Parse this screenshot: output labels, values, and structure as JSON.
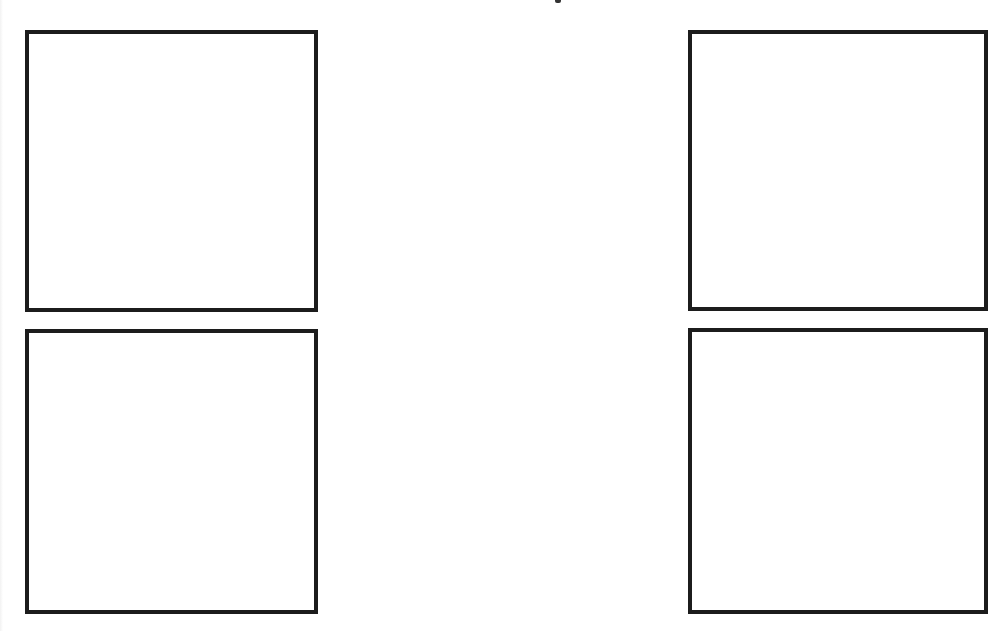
{
  "canvas": {
    "width": 968,
    "height": 631,
    "background": "#ffffff"
  },
  "style": {
    "border_color": "#1c1c1c",
    "border_width_px": 4
  },
  "panels": [
    {
      "id": "top-left",
      "label": "",
      "x": 25,
      "y": 30,
      "width": 293,
      "height": 282,
      "clipped_right": false
    },
    {
      "id": "bottom-left",
      "label": "",
      "x": 25,
      "y": 329,
      "width": 293,
      "height": 285,
      "clipped_right": false
    },
    {
      "id": "top-right",
      "label": "",
      "x": 688,
      "y": 30,
      "width": 300,
      "height": 281,
      "clipped_right": true
    },
    {
      "id": "bottom-right",
      "label": "",
      "x": 688,
      "y": 328,
      "width": 300,
      "height": 286,
      "clipped_right": true
    }
  ]
}
